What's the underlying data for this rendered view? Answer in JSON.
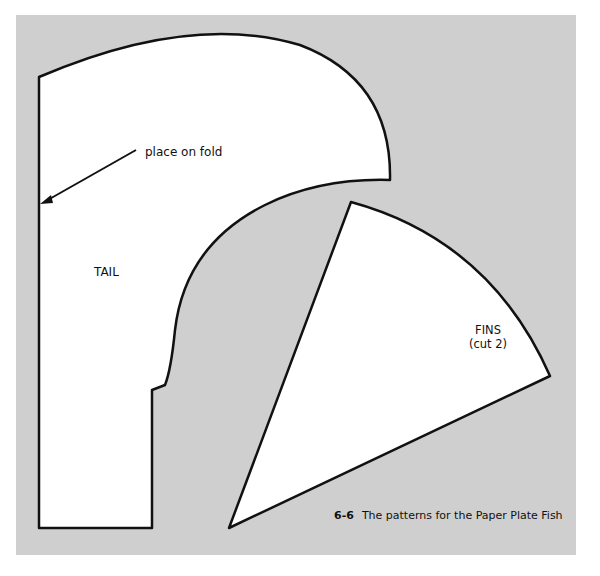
{
  "figure": {
    "number": "6-6",
    "caption": "The patterns for the Paper Plate Fish"
  },
  "patterns": {
    "tail": {
      "label": "TAIL",
      "annotation": "place on fold"
    },
    "fins": {
      "label": "FINS",
      "note": "(cut 2)"
    }
  },
  "colors": {
    "background": "#cfcfcf",
    "shape_fill": "#ffffff",
    "outline": "#111111"
  }
}
